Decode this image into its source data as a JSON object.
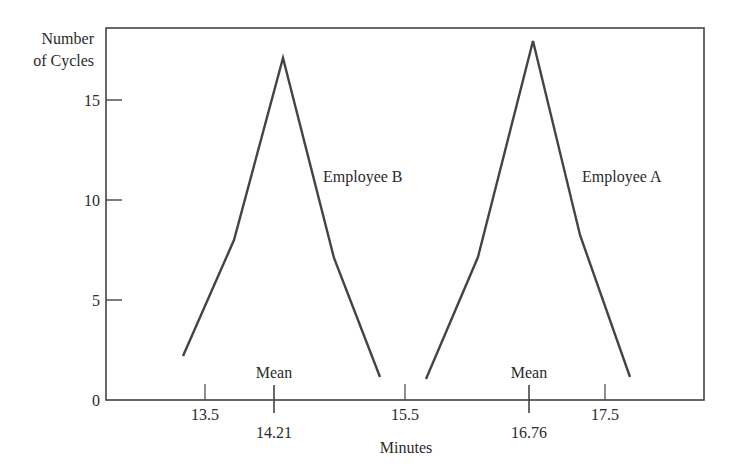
{
  "chart_data": {
    "type": "line",
    "title": "",
    "xlabel": "Minutes",
    "ylabel": [
      "Number",
      "of Cycles"
    ],
    "xlim": [
      12.0,
      18.0
    ],
    "ylim": [
      0,
      18.6
    ],
    "grid": false,
    "legend": "inline labels",
    "y_ticks": [
      {
        "value": 0,
        "label": "0"
      },
      {
        "value": 5,
        "label": "5"
      },
      {
        "value": 10,
        "label": "10"
      },
      {
        "value": 15,
        "label": "15"
      }
    ],
    "x_ticks": [
      {
        "value": 13.5,
        "label": "13.5"
      },
      {
        "value": 15.5,
        "label": "15.5"
      },
      {
        "value": 17.5,
        "label": "17.5"
      }
    ],
    "mean_markers": [
      {
        "value": 14.21,
        "label": "14.21",
        "caption": "Mean"
      },
      {
        "value": 16.76,
        "label": "16.76",
        "caption": "Mean"
      }
    ],
    "series": [
      {
        "name": "Employee B",
        "x": [
          13.28,
          13.79,
          14.28,
          14.79,
          15.25
        ],
        "y": [
          2.2,
          8.0,
          17.1,
          7.1,
          1.15
        ],
        "label_pos": {
          "x": 14.68,
          "y": 10.9
        }
      },
      {
        "name": "Employee A",
        "x": [
          15.71,
          16.23,
          16.78,
          17.25,
          17.75
        ],
        "y": [
          1.05,
          7.15,
          17.95,
          8.25,
          1.15
        ],
        "label_pos": {
          "x": 17.27,
          "y": 10.9
        }
      }
    ],
    "colors": {
      "line": "#444444",
      "axis": "#444444",
      "text": "#2a2a2a"
    }
  }
}
